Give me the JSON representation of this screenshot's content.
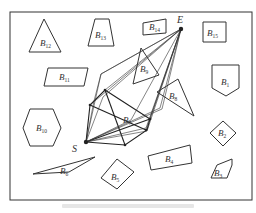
{
  "diagram": {
    "frame": {
      "x": 10,
      "y": 12,
      "w": 242,
      "h": 188
    },
    "points": {
      "start": {
        "label": "S",
        "x": 86,
        "y": 142
      },
      "end": {
        "label": "E",
        "x": 181,
        "y": 29
      }
    },
    "obstacles": [
      {
        "id": "B1",
        "base": "B",
        "sub": "1",
        "shape": "pentagon-down",
        "points": "212,65 239,65 239,88 226,96 212,88",
        "lx": 221,
        "ly": 85
      },
      {
        "id": "B2",
        "base": "B",
        "sub": "2",
        "shape": "diamond",
        "points": "223,121 236,133 223,146 210,133",
        "lx": 218,
        "ly": 136
      },
      {
        "id": "B3",
        "base": "B",
        "sub": "3",
        "shape": "pentagon",
        "points": "217,165 232,159 232,165 227,178 211,178",
        "lx": 214,
        "ly": 176
      },
      {
        "id": "B4",
        "base": "B",
        "sub": "4",
        "shape": "rectangle",
        "points": "148,156 190,145 192,163 151,170",
        "lx": 165,
        "ly": 162
      },
      {
        "id": "B5",
        "base": "B",
        "sub": "5",
        "shape": "rectangle",
        "points": "101,178 117,159 134,172 117,189",
        "lx": 111,
        "ly": 180
      },
      {
        "id": "B6",
        "base": "B",
        "sub": "6",
        "shape": "triangle",
        "points": "33,174 95,157 69,172",
        "lx": 60,
        "ly": 174
      },
      {
        "id": "B7",
        "base": "B",
        "sub": "7",
        "shape": "label-only",
        "points": "",
        "lx": 123,
        "ly": 123
      },
      {
        "id": "B8",
        "base": "B",
        "sub": "8",
        "shape": "triangle",
        "points": "157,92 178,79 194,116",
        "lx": 169,
        "ly": 99
      },
      {
        "id": "B9",
        "base": "B",
        "sub": "9",
        "shape": "triangle",
        "points": "141,48 159,75 133,84",
        "lx": 140,
        "ly": 72
      },
      {
        "id": "B10",
        "base": "B",
        "sub": "10",
        "shape": "hexagon",
        "points": "30,109 53,109 61,128 53,146 30,146 23,128",
        "lx": 36,
        "ly": 131
      },
      {
        "id": "B11",
        "base": "B",
        "sub": "11",
        "shape": "parallelogram",
        "points": "48,68 88,68 84,86 44,86",
        "lx": 59,
        "ly": 80
      },
      {
        "id": "B12",
        "base": "B",
        "sub": "12",
        "shape": "triangle",
        "points": "44,19 61,52 29,52",
        "lx": 40,
        "ly": 46
      },
      {
        "id": "B13",
        "base": "B",
        "sub": "13",
        "shape": "trapezoid",
        "points": "95,19 109,19 114,46 88,46",
        "lx": 95,
        "ly": 38
      },
      {
        "id": "B14",
        "base": "B",
        "sub": "14",
        "shape": "quad",
        "points": "143,23 166,19 166,33 143,35",
        "lx": 149,
        "ly": 30
      },
      {
        "id": "B15",
        "base": "B",
        "sub": "15",
        "shape": "rectangle",
        "points": "203,22 226,22 226,42 203,42",
        "lx": 207,
        "ly": 36
      }
    ],
    "visibility_paths": [
      "86,142 103,97 181,29",
      "86,142 146,128 181,29",
      "86,142 101,74 181,29",
      "86,142 162,109 181,29",
      "86,142 131,120 181,29",
      "86,142 160,108 181,29",
      "86,142 94,101 101,74 181,29",
      "86,142 147,131 181,29"
    ],
    "polygon_path": "86,142 90,105 105,90 150,119 147,130 125,145 86,142",
    "cross_edges": [
      "90,105 146,130",
      "105,90 125,145",
      "86,142 150,119",
      "90,105 181,29",
      "105,90 181,29",
      "146,130 181,29",
      "150,119 181,29"
    ],
    "caption_visible": "illegible"
  }
}
